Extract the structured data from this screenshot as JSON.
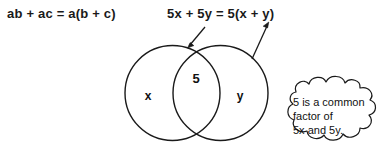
{
  "figure": {
    "title_equations": {
      "left": "ab + ac = a(b + c)",
      "right": "5x + 5y = 5(x + y)"
    },
    "venn": {
      "left_circle_label": "x",
      "right_circle_label": "y",
      "intersection_label": "5"
    },
    "callout": {
      "line1": "5 is a common",
      "line2": "factor of",
      "line3": "5x and 5y."
    },
    "colors": {
      "stroke": "#1a1a1a",
      "text": "#111111",
      "background": "#ffffff"
    }
  }
}
